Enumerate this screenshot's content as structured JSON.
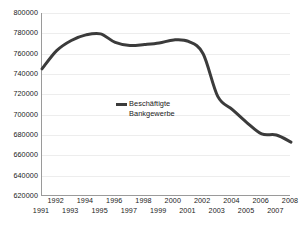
{
  "chart_data": {
    "type": "line",
    "title": "",
    "subtitle": "",
    "xlabel": "",
    "ylabel": "",
    "grid": true,
    "legend_position": "inside-center-left",
    "ylim": [
      620000,
      800000
    ],
    "xlim": [
      1991,
      2008
    ],
    "y_ticks": [
      800000,
      780000,
      760000,
      740000,
      720000,
      700000,
      680000,
      660000,
      640000,
      620000
    ],
    "y_tick_labels": [
      "800000",
      "780000",
      "760000",
      "740000",
      "720000",
      "700000",
      "680000",
      "660000",
      "640000",
      "620000"
    ],
    "x_ticks": [
      1991,
      1992,
      1993,
      1994,
      1995,
      1996,
      1997,
      1998,
      1999,
      2000,
      2001,
      2002,
      2003,
      2004,
      2005,
      2006,
      2007,
      2008
    ],
    "x_tick_labels_bottom_row": [
      "1991",
      "1993",
      "1995",
      "1997",
      "1999",
      "2001",
      "2003",
      "2005",
      "2007"
    ],
    "x_tick_labels_top_row": [
      "1992",
      "1994",
      "1996",
      "1998",
      "2000",
      "2002",
      "2004",
      "2006",
      "2008"
    ],
    "categories": [
      "1991",
      "1992",
      "1993",
      "1994",
      "1995",
      "1996",
      "1997",
      "1998",
      "1999",
      "2000",
      "2001",
      "2002",
      "2003",
      "2004",
      "2005",
      "2006",
      "2007",
      "2008"
    ],
    "series": [
      {
        "name": "Beschäftigte Bankgewerbe",
        "color": "#3b3b3b",
        "values": [
          745000,
          763000,
          773000,
          778500,
          779500,
          771000,
          768000,
          769000,
          770500,
          773500,
          772000,
          760000,
          718000,
          705000,
          692000,
          681000,
          680000,
          673000
        ]
      }
    ],
    "legend": [
      {
        "label": "Beschäftigte\nBankgewerbe",
        "color": "#3b3b3b"
      }
    ]
  },
  "legend": {
    "series_label": "Beschäftigte\nBankgewerbe"
  },
  "colors": {
    "line": "#3b3b3b",
    "axis": "#9a9a9a",
    "grid": "#ededed",
    "text": "#1a1a1a",
    "background": "#ffffff"
  }
}
